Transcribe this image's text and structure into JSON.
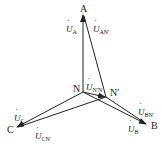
{
  "diagram": {
    "type": "phasor-diagram",
    "points": {
      "A": {
        "label": "A",
        "x": 84,
        "y": 13
      },
      "B": {
        "label": "B",
        "x": 146,
        "y": 125
      },
      "C": {
        "label": "C",
        "x": 16,
        "y": 127
      },
      "N": {
        "label": "N",
        "x": 83,
        "y": 92
      },
      "Nprime": {
        "label": "N'",
        "x": 106,
        "y": 97
      }
    },
    "vectors": [
      {
        "id": "U_A",
        "from": "N",
        "to": "A",
        "symbol": "U",
        "sub": "A"
      },
      {
        "id": "U_AN'",
        "from": "Nprime",
        "to": "A",
        "symbol": "U",
        "sub": "AN'"
      },
      {
        "id": "U_B",
        "from": "N",
        "to": "B",
        "symbol": "U",
        "sub": "B"
      },
      {
        "id": "U_BN'",
        "from": "Nprime",
        "to": "B",
        "symbol": "U",
        "sub": "BN'"
      },
      {
        "id": "U_C",
        "from": "N",
        "to": "C",
        "symbol": "U",
        "sub": "C"
      },
      {
        "id": "U_CN'",
        "from": "Nprime",
        "to": "C",
        "symbol": "U",
        "sub": "CN'"
      },
      {
        "id": "U_N'N",
        "from": "N",
        "to": "Nprime",
        "symbol": "U",
        "sub": "N'N"
      }
    ],
    "labels": {
      "A": "A",
      "B": "B",
      "C": "C",
      "N": "N",
      "Nprime": "N'",
      "U": "U",
      "sub_A": "A",
      "sub_AN": "AN'",
      "sub_B": "B",
      "sub_BN": "BN'",
      "sub_C": "C",
      "sub_CN": "CN'",
      "sub_NN": "N'N"
    },
    "line_color": "#222222"
  }
}
